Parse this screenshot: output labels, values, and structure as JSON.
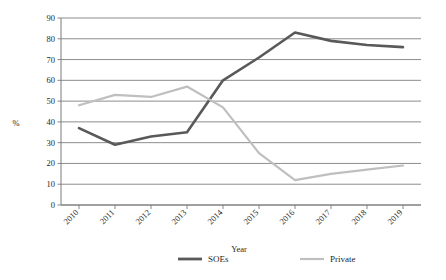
{
  "chart_data": {
    "type": "line",
    "title": "",
    "xlabel": "Year",
    "ylabel": "%",
    "categories": [
      "2010",
      "2011",
      "2012",
      "2013",
      "2014",
      "2015",
      "2016",
      "2017",
      "2018",
      "2019"
    ],
    "ylim": [
      0,
      90
    ],
    "ytick_step": 10,
    "yticks": [
      "0",
      "10",
      "20",
      "30",
      "40",
      "50",
      "60",
      "70",
      "80",
      "90"
    ],
    "grid": true,
    "legend_position": "bottom",
    "series": [
      {
        "name": "SOEs",
        "color": "#595959",
        "values": [
          37,
          29,
          33,
          35,
          60,
          71,
          83,
          79,
          77,
          76
        ]
      },
      {
        "name": "Private",
        "color": "#bfbfbf",
        "values": [
          48,
          53,
          52,
          57,
          47,
          25,
          12,
          15,
          17,
          19
        ]
      }
    ]
  },
  "legend": {
    "entries": [
      {
        "label": "SOEs"
      },
      {
        "label": "Private"
      }
    ]
  },
  "axis": {
    "y_label": "%",
    "x_label": "Year"
  }
}
